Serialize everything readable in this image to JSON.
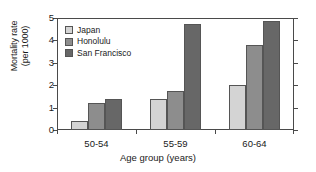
{
  "chart_data": {
    "type": "bar",
    "title": "",
    "xlabel": "Age group (years)",
    "ylabel": "Mortality rate (per 1000)",
    "ylabel_line1": "Mortality rate",
    "ylabel_line2": "(per 1000)",
    "categories": [
      "50-54",
      "55-59",
      "60-64"
    ],
    "series": [
      {
        "name": "Japan",
        "values": [
          0.4,
          1.4,
          2.0
        ],
        "color": "#d4d4d4"
      },
      {
        "name": "Honolulu",
        "values": [
          1.2,
          1.75,
          3.8
        ],
        "color": "#8d8d8d"
      },
      {
        "name": "San Francisco",
        "values": [
          1.4,
          4.75,
          4.85
        ],
        "color": "#676767"
      }
    ],
    "ylim": [
      0,
      5
    ],
    "yticks": [
      0,
      1,
      2,
      3,
      4,
      5
    ],
    "ytick_labels": [
      "0",
      "1",
      "2",
      "3",
      "4",
      "5"
    ],
    "grid": false,
    "legend_position": "top-left",
    "axis_color": "#4a4a4a",
    "bar_edge_color": "#555555"
  },
  "legend": {
    "entries": [
      {
        "label": "Japan"
      },
      {
        "label": "Honolulu"
      },
      {
        "label": "San Francisco"
      }
    ]
  }
}
